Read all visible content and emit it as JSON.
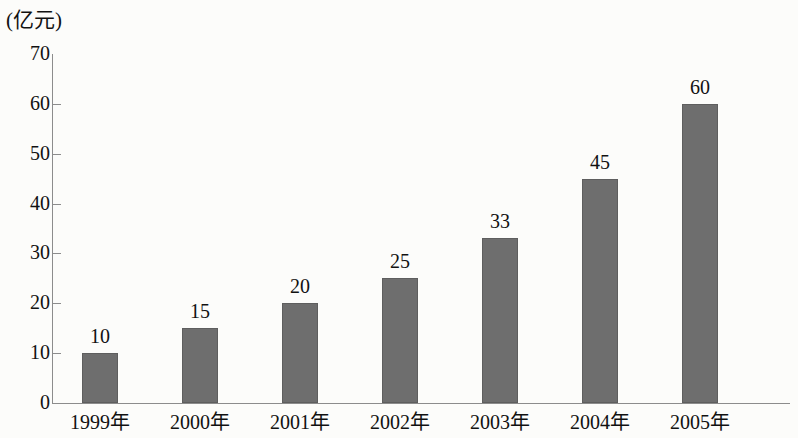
{
  "chart_data": {
    "type": "bar",
    "title": "",
    "subtitle": "",
    "xlabel": "",
    "ylabel": "(亿元)",
    "unit_caption": "(亿元)",
    "categories": [
      "1999年",
      "2000年",
      "2001年",
      "2002年",
      "2003年",
      "2004年",
      "2005年"
    ],
    "values": [
      10,
      15,
      20,
      25,
      33,
      45,
      60
    ],
    "value_labels": [
      "10",
      "15",
      "20",
      "25",
      "33",
      "45",
      "60"
    ],
    "ylim": [
      0,
      70
    ],
    "ytick_labels": [
      "0",
      "10",
      "20",
      "30",
      "40",
      "50",
      "60",
      "70"
    ],
    "ytick_values": [
      0,
      10,
      20,
      30,
      40,
      50,
      60,
      70
    ],
    "grid": false,
    "legend": null,
    "bar_color": "#6e6e6e",
    "axis_color": "#8c8c8c",
    "background_color": "#fcfcfa",
    "text_color": "#111111"
  }
}
